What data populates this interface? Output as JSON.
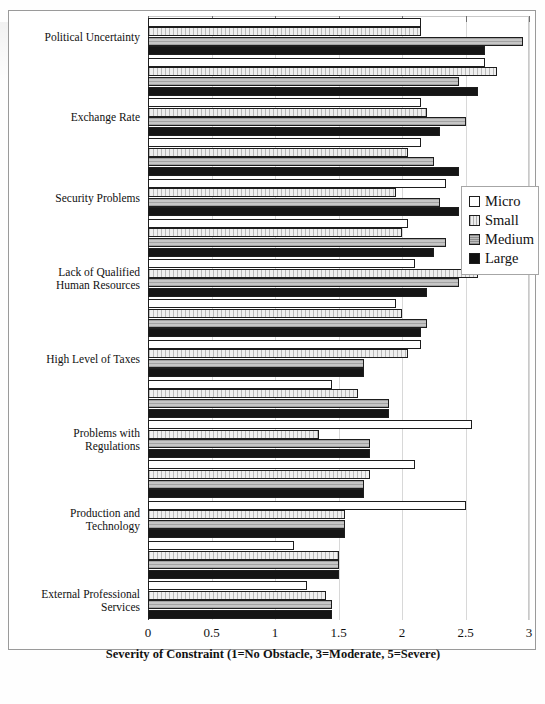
{
  "chart_data": {
    "type": "bar",
    "orientation": "horizontal",
    "title": "",
    "xlabel": "Severity of Constraint (1=No Obstacle, 3=Moderate, 5=Severe)",
    "ylabel": "",
    "xlim": [
      0,
      3
    ],
    "xticks": [
      0,
      0.5,
      1,
      1.5,
      2,
      2.5,
      3
    ],
    "xticklabels": [
      "0",
      "0.5",
      "1",
      "1.5",
      "2",
      "2.5",
      "3"
    ],
    "grid": true,
    "legend_position": "right",
    "legend": [
      "Micro",
      "Small",
      "Medium",
      "Large"
    ],
    "series_colors": {
      "Micro": "#ffffff",
      "Small": "#e3e3e3",
      "Medium": "#b3b3b3",
      "Large": "#151515"
    },
    "categories": [
      "Political Uncertainty",
      "",
      "Exchange Rate",
      "",
      "Security Problems",
      "",
      "Lack of Qualified\nHuman Resources",
      "",
      "High Level of Taxes",
      "",
      "Problems with\nRegulations",
      "",
      "Production and\nTechnology",
      "",
      "External Professional\nServices"
    ],
    "series": [
      {
        "name": "Micro",
        "values": [
          2.15,
          2.65,
          2.15,
          2.15,
          2.35,
          2.05,
          2.1,
          1.95,
          2.15,
          1.45,
          2.55,
          2.1,
          2.5,
          1.15,
          1.25
        ]
      },
      {
        "name": "Small",
        "values": [
          2.15,
          2.75,
          2.2,
          2.05,
          1.95,
          2.0,
          2.6,
          2.0,
          2.05,
          1.65,
          1.35,
          1.75,
          1.55,
          1.5,
          1.4
        ]
      },
      {
        "name": "Medium",
        "values": [
          2.95,
          2.45,
          2.5,
          2.25,
          2.3,
          2.35,
          2.45,
          2.2,
          1.7,
          1.9,
          1.75,
          1.7,
          1.55,
          1.5,
          1.45
        ]
      },
      {
        "name": "Large",
        "values": [
          2.65,
          2.6,
          2.3,
          2.45,
          2.45,
          2.25,
          2.2,
          2.15,
          1.7,
          1.9,
          1.75,
          1.7,
          1.55,
          1.5,
          1.45
        ]
      }
    ]
  },
  "legend": {
    "items": [
      {
        "label": "Micro",
        "key": "micro"
      },
      {
        "label": "Small",
        "key": "small"
      },
      {
        "label": "Medium",
        "key": "medium"
      },
      {
        "label": "Large",
        "key": "large"
      }
    ]
  },
  "axis": {
    "x_title": "Severity of Constraint (1=No Obstacle, 3=Moderate, 5=Severe)",
    "tick_labels": [
      "0",
      "0.5",
      "1",
      "1.5",
      "2",
      "2.5",
      "3"
    ]
  },
  "category_labels": [
    "Political Uncertainty",
    "Exchange Rate",
    "Security Problems",
    "Lack of Qualified\nHuman Resources",
    "High Level of Taxes",
    "Problems with\nRegulations",
    "Production and\nTechnology",
    "External Professional\nServices"
  ]
}
